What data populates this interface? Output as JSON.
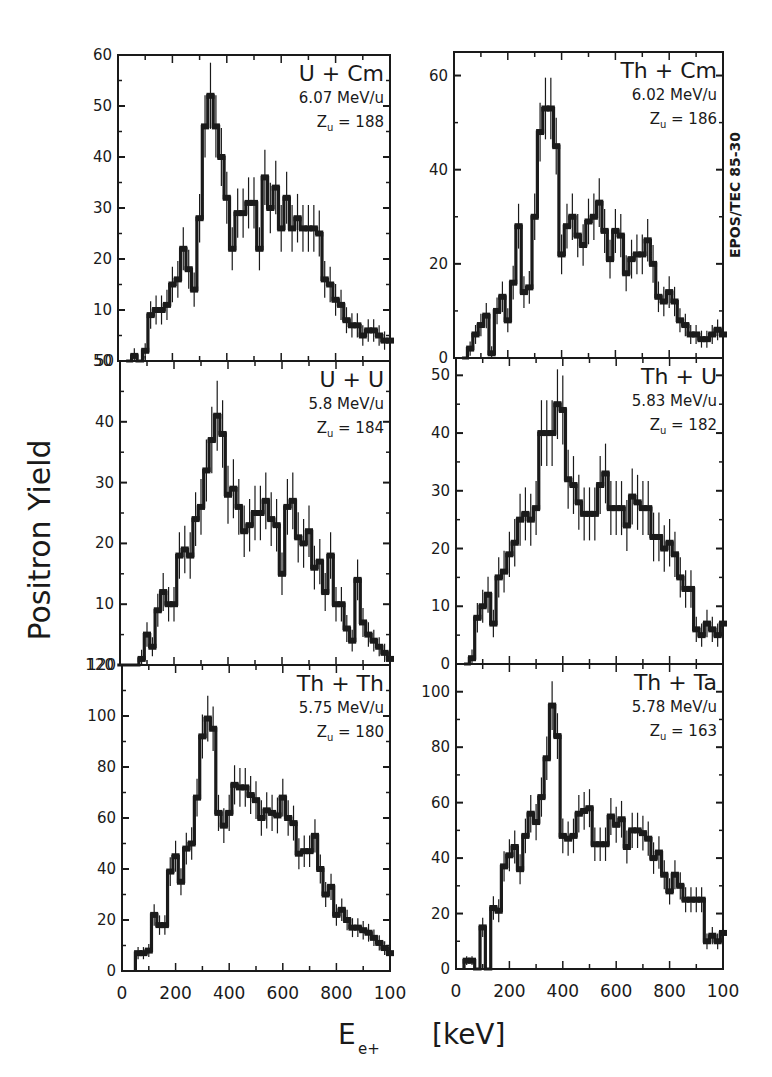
{
  "figure": {
    "y_axis_label": "Positron Yield",
    "x_axis_label_main": "E",
    "x_axis_label_sub": "e+",
    "x_axis_unit": "[keV]",
    "side_label": "EPOS/TEC 85-30"
  },
  "chart_data": [
    {
      "type": "bar",
      "style": "step-histogram-with-error-bars",
      "panel": "top-left",
      "title": "U + Cm",
      "energy": "6.07 MeV/u",
      "zu_label": "Z",
      "zu_sub": "u",
      "zu_value": "= 188",
      "xlabel": "E_e+ [keV]",
      "ylabel": "Positron Yield",
      "xlim": [
        0,
        1000
      ],
      "ylim": [
        0,
        60
      ],
      "yticks": [
        0,
        10,
        20,
        30,
        40,
        50,
        60
      ],
      "ytick_labels": [
        "50",
        "10",
        "20",
        "30",
        "40",
        "50",
        "60"
      ],
      "x": [
        40,
        60,
        80,
        100,
        120,
        140,
        160,
        180,
        200,
        220,
        240,
        260,
        280,
        300,
        320,
        340,
        360,
        380,
        400,
        420,
        440,
        460,
        480,
        500,
        520,
        540,
        560,
        580,
        600,
        620,
        640,
        660,
        680,
        700,
        720,
        740,
        760,
        780,
        800,
        820,
        840,
        860,
        880,
        900,
        920,
        940,
        960,
        980,
        1000
      ],
      "values": [
        0,
        1,
        0,
        2,
        9,
        10,
        10,
        11,
        15,
        16,
        22,
        18,
        14,
        28,
        46,
        52,
        46,
        40,
        32,
        22,
        29,
        29,
        31,
        31,
        22,
        36,
        30,
        34,
        26,
        32,
        26,
        28,
        26,
        26,
        26,
        25,
        16,
        15,
        12,
        11,
        8,
        7,
        7,
        5,
        6,
        6,
        5,
        4,
        4
      ]
    },
    {
      "type": "bar",
      "style": "step-histogram-with-error-bars",
      "panel": "top-right",
      "title": "Th + Cm",
      "energy": "6.02 MeV/u",
      "zu_label": "Z",
      "zu_sub": "u",
      "zu_value": "= 186",
      "xlabel": "E_e+ [keV]",
      "ylabel": "Positron Yield",
      "xlim": [
        0,
        1000
      ],
      "ylim": [
        0,
        65
      ],
      "yticks": [
        0,
        20,
        40,
        60
      ],
      "ytick_labels": [
        "0",
        "20",
        "40",
        "60"
      ],
      "x": [
        40,
        60,
        80,
        100,
        120,
        140,
        160,
        180,
        200,
        220,
        240,
        260,
        280,
        300,
        320,
        340,
        360,
        380,
        400,
        420,
        440,
        460,
        480,
        500,
        520,
        540,
        560,
        580,
        600,
        620,
        640,
        660,
        680,
        700,
        720,
        740,
        760,
        780,
        800,
        820,
        840,
        860,
        880,
        900,
        920,
        940,
        960,
        980,
        1000
      ],
      "values": [
        0,
        2,
        5,
        7,
        9,
        1,
        10,
        13,
        8,
        16,
        28,
        14,
        15,
        30,
        48,
        53,
        53,
        45,
        22,
        28,
        30,
        26,
        24,
        29,
        30,
        33,
        27,
        21,
        27,
        26,
        18,
        21,
        22,
        22,
        25,
        20,
        13,
        12,
        14,
        12,
        8,
        7,
        5,
        5,
        4,
        4,
        5,
        6,
        5
      ]
    },
    {
      "type": "bar",
      "style": "step-histogram-with-error-bars",
      "panel": "middle-left",
      "title": "U + U",
      "energy": "5.8 MeV/u",
      "zu_label": "Z",
      "zu_sub": "u",
      "zu_value": "= 184",
      "xlabel": "E_e+ [keV]",
      "ylabel": "Positron Yield",
      "xlim": [
        0,
        1000
      ],
      "ylim": [
        0,
        50
      ],
      "yticks": [
        0,
        10,
        20,
        30,
        40,
        50
      ],
      "ytick_labels": [
        "120",
        "10",
        "20",
        "30",
        "40",
        "50"
      ],
      "x": [
        0,
        20,
        40,
        60,
        80,
        100,
        120,
        140,
        160,
        180,
        200,
        220,
        240,
        260,
        280,
        300,
        320,
        340,
        360,
        380,
        400,
        420,
        440,
        460,
        480,
        500,
        520,
        540,
        560,
        580,
        600,
        620,
        640,
        660,
        680,
        700,
        720,
        740,
        760,
        780,
        800,
        820,
        840,
        860,
        880,
        900,
        920,
        940,
        960,
        980,
        1000
      ],
      "values": [
        0,
        0,
        0,
        0,
        1,
        5,
        3,
        9,
        12,
        10,
        10,
        18,
        19,
        18,
        24,
        26,
        32,
        37,
        41,
        38,
        28,
        29,
        26,
        22,
        23,
        25,
        25,
        27,
        24,
        23,
        15,
        26,
        27,
        21,
        20,
        22,
        16,
        17,
        12,
        18,
        10,
        10,
        6,
        4,
        14,
        7,
        5,
        4,
        3,
        2,
        1
      ]
    },
    {
      "type": "bar",
      "style": "step-histogram-with-error-bars",
      "panel": "middle-right",
      "title": "Th + U",
      "energy": "5.83 MeV/u",
      "zu_label": "Z",
      "zu_sub": "u",
      "zu_value": "= 182",
      "xlabel": "E_e+ [keV]",
      "ylabel": "Positron Yield",
      "xlim": [
        0,
        1000
      ],
      "ylim": [
        0,
        53
      ],
      "yticks": [
        0,
        10,
        20,
        30,
        40,
        50
      ],
      "ytick_labels": [
        "0",
        "10",
        "20",
        "30",
        "40",
        "50"
      ],
      "x": [
        40,
        60,
        80,
        100,
        120,
        140,
        160,
        180,
        200,
        220,
        240,
        260,
        280,
        300,
        320,
        340,
        360,
        380,
        400,
        420,
        440,
        460,
        480,
        500,
        520,
        540,
        560,
        580,
        600,
        620,
        640,
        660,
        680,
        700,
        720,
        740,
        760,
        780,
        800,
        820,
        840,
        860,
        880,
        900,
        920,
        940,
        960,
        980,
        1000
      ],
      "values": [
        0,
        1,
        8,
        10,
        12,
        7,
        15,
        16,
        19,
        21,
        25,
        26,
        25,
        27,
        40,
        40,
        40,
        45,
        44,
        32,
        31,
        28,
        26,
        26,
        26,
        31,
        33,
        27,
        27,
        27,
        24,
        29,
        28,
        27,
        27,
        22,
        22,
        20,
        21,
        19,
        15,
        13,
        13,
        6,
        5,
        7,
        6,
        5,
        7
      ]
    },
    {
      "type": "bar",
      "style": "step-histogram-with-error-bars",
      "panel": "bottom-left",
      "title": "Th + Th",
      "energy": "5.75 MeV/u",
      "zu_label": "Z",
      "zu_sub": "u",
      "zu_value": "= 180",
      "xlabel": "E_e+ [keV]",
      "ylabel": "Positron Yield",
      "xlim": [
        0,
        1000
      ],
      "ylim": [
        0,
        120
      ],
      "yticks": [
        0,
        20,
        40,
        60,
        80,
        100,
        120
      ],
      "ytick_labels": [
        "0",
        "20",
        "40",
        "60",
        "80",
        "100",
        "120"
      ],
      "xticks": [
        0,
        200,
        400,
        600,
        800,
        1000
      ],
      "xtick_labels": [
        "0",
        "200",
        "400",
        "600",
        "800",
        "100"
      ],
      "x": [
        60,
        80,
        100,
        120,
        140,
        160,
        180,
        200,
        220,
        240,
        260,
        280,
        300,
        320,
        340,
        360,
        380,
        400,
        420,
        440,
        460,
        480,
        500,
        520,
        540,
        560,
        580,
        600,
        620,
        640,
        660,
        680,
        700,
        720,
        740,
        760,
        780,
        800,
        820,
        840,
        860,
        880,
        900,
        920,
        940,
        960,
        980,
        1000
      ],
      "values": [
        7,
        7,
        8,
        22,
        18,
        18,
        39,
        45,
        35,
        48,
        50,
        68,
        92,
        99,
        95,
        62,
        57,
        62,
        73,
        72,
        72,
        69,
        67,
        60,
        63,
        62,
        61,
        68,
        60,
        58,
        46,
        47,
        47,
        53,
        40,
        30,
        33,
        22,
        24,
        20,
        17,
        17,
        16,
        15,
        13,
        11,
        9,
        7
      ]
    },
    {
      "type": "bar",
      "style": "step-histogram-with-error-bars",
      "panel": "bottom-right",
      "title": "Th + Ta",
      "energy": "5.78 MeV/u",
      "zu_label": "Z",
      "zu_sub": "u",
      "zu_value": "= 163",
      "xlabel": "E_e+ [keV]",
      "ylabel": "Positron Yield",
      "xlim": [
        0,
        1000
      ],
      "ylim": [
        0,
        110
      ],
      "yticks": [
        0,
        20,
        40,
        60,
        80,
        100
      ],
      "ytick_labels": [
        "0",
        "20",
        "40",
        "60",
        "80",
        "100"
      ],
      "xticks": [
        0,
        200,
        400,
        600,
        800,
        1000
      ],
      "xtick_labels": [
        "0",
        "200",
        "400",
        "600",
        "800",
        "100"
      ],
      "x": [
        40,
        60,
        80,
        100,
        120,
        140,
        160,
        180,
        200,
        220,
        240,
        260,
        280,
        300,
        320,
        340,
        360,
        380,
        400,
        420,
        440,
        460,
        480,
        500,
        520,
        540,
        560,
        580,
        600,
        620,
        640,
        660,
        680,
        700,
        720,
        740,
        760,
        780,
        800,
        820,
        840,
        860,
        880,
        900,
        920,
        940,
        960,
        980,
        1000
      ],
      "values": [
        3,
        3,
        0,
        15,
        0,
        22,
        21,
        37,
        41,
        44,
        36,
        48,
        56,
        53,
        62,
        76,
        95,
        84,
        48,
        47,
        48,
        56,
        57,
        58,
        45,
        45,
        45,
        55,
        52,
        54,
        44,
        50,
        50,
        49,
        47,
        40,
        42,
        34,
        28,
        34,
        30,
        25,
        25,
        25,
        25,
        10,
        12,
        10,
        13
      ]
    }
  ]
}
